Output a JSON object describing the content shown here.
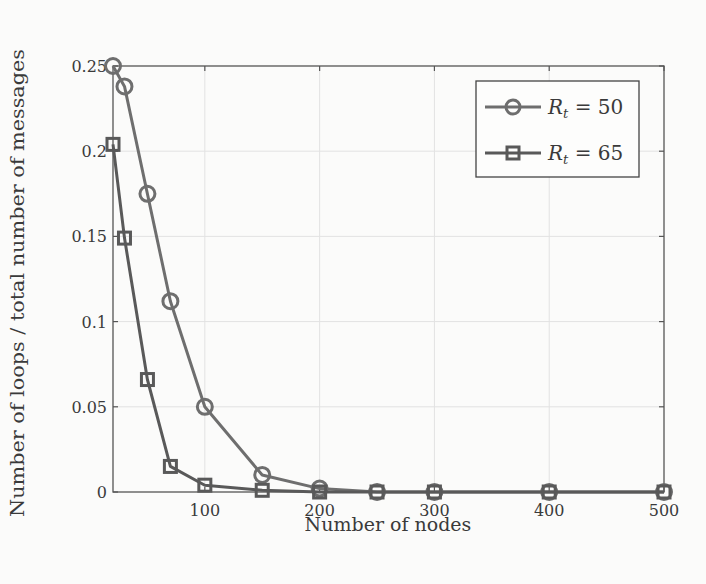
{
  "chart_data": {
    "type": "line",
    "title": "",
    "xlabel": "Number of nodes",
    "ylabel": "Number of loops / total number of messages",
    "xlim": [
      20,
      500
    ],
    "ylim": [
      0,
      0.25
    ],
    "xticks": [
      100,
      200,
      300,
      400,
      500
    ],
    "xtick_labels": [
      "100",
      "200",
      "300",
      "400",
      "500"
    ],
    "yticks": [
      0,
      0.05,
      0.1,
      0.15,
      0.2,
      0.25
    ],
    "ytick_labels": [
      "0",
      "0.05",
      "0.1",
      "0.15",
      "0.2",
      "0.25"
    ],
    "grid": true,
    "legend_position": "upper right",
    "x": [
      20,
      30,
      50,
      70,
      100,
      150,
      200,
      250,
      300,
      400,
      500
    ],
    "series": [
      {
        "name": "R_t = 50",
        "label_main": "R",
        "label_sub": "t",
        "label_rest": " = 50",
        "marker": "circle",
        "color": "#6e6e6e",
        "values": [
          0.25,
          0.238,
          0.175,
          0.112,
          0.05,
          0.01,
          0.002,
          0.0,
          0.0,
          0.0,
          0.0
        ]
      },
      {
        "name": "R_t = 65",
        "label_main": "R",
        "label_sub": "t",
        "label_rest": " = 65",
        "marker": "square",
        "color": "#595959",
        "values": [
          0.204,
          0.149,
          0.066,
          0.015,
          0.004,
          0.001,
          0.0,
          0.0,
          0.0,
          0.0,
          0.0
        ]
      }
    ]
  }
}
